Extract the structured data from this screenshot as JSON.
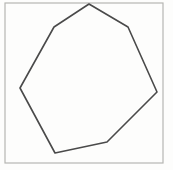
{
  "figure": {
    "shape_name": "heptagon",
    "sides": 7,
    "canvas": {
      "width": 173,
      "height": 170
    },
    "background_color": "#fdfdfc",
    "frame": {
      "name": "figure-border",
      "x": 5,
      "y": 3,
      "width": 158,
      "height": 160,
      "stroke_color": "#b6b6b2",
      "stroke_width": 1.2,
      "fill": "none"
    },
    "polygon": {
      "name": "heptagon-outline",
      "stroke_color": "#4a4a4a",
      "stroke_width": 1.6,
      "fill": "none",
      "closed": true,
      "points": "89,4 128,27 157,92 107,142 55,153 20,88 54,27",
      "vertices": [
        {
          "label": "top",
          "x": 89,
          "y": 4
        },
        {
          "label": "upper-right",
          "x": 128,
          "y": 27
        },
        {
          "label": "right",
          "x": 157,
          "y": 92
        },
        {
          "label": "lower-right",
          "x": 107,
          "y": 142
        },
        {
          "label": "bottom",
          "x": 55,
          "y": 153
        },
        {
          "label": "left",
          "x": 20,
          "y": 88
        },
        {
          "label": "upper-left",
          "x": 54,
          "y": 27
        }
      ]
    }
  }
}
